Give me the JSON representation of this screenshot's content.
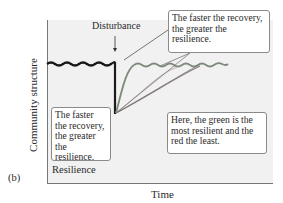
{
  "figure": {
    "panel_label": "(b)",
    "section_label": "Resilience",
    "y_axis_label": "Community structure",
    "x_axis_label": "Time",
    "disturbance_label": "Disturbance"
  },
  "callouts": [
    {
      "text": "The faster the recovery, the greater the resilience."
    },
    {
      "text": "The faster the recovery, the greater the resilience."
    },
    {
      "text": "Here, the green is the most resilient and the red the least."
    }
  ],
  "curves": [
    {
      "name": "baseline",
      "color": "#1a1a1a"
    },
    {
      "name": "green",
      "color": "#7d8a7a"
    },
    {
      "name": "pink",
      "color": "#c9b9bb"
    },
    {
      "name": "red",
      "color": "#8a7a7c"
    }
  ]
}
